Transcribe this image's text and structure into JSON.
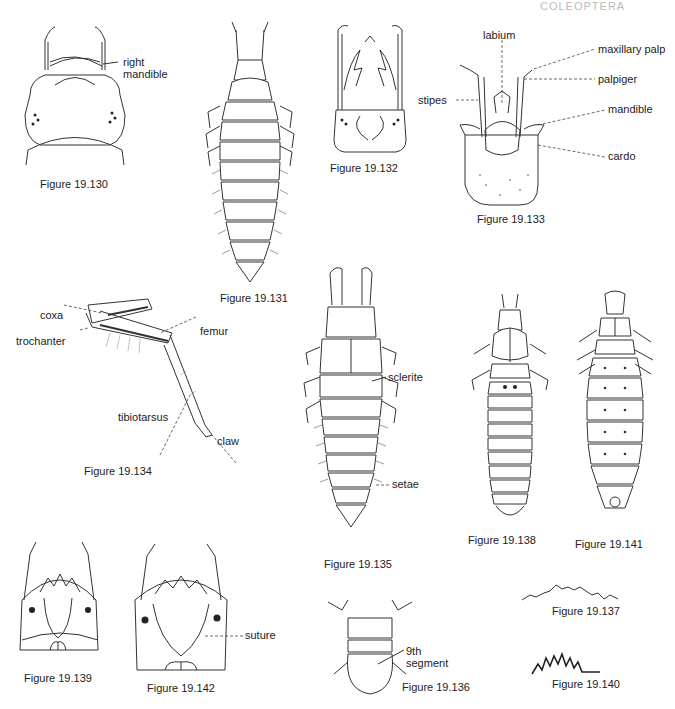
{
  "page_header": "COLEOPTERA",
  "figures": {
    "f130": {
      "caption": "Figure 19.130",
      "labels": [
        "right",
        "mandible"
      ]
    },
    "f131": {
      "caption": "Figure 19.131"
    },
    "f132": {
      "caption": "Figure 19.132"
    },
    "f133": {
      "caption": "Figure 19.133",
      "labels": {
        "labium": "labium",
        "maxillary_palp": "maxillary palp",
        "palpiger": "palpiger",
        "stipes": "stipes",
        "mandible": "mandible",
        "cardo": "cardo"
      }
    },
    "f134": {
      "caption": "Figure 19.134",
      "labels": {
        "coxa": "coxa",
        "trochanter": "trochanter",
        "femur": "femur",
        "tibiotarsus": "tibiotarsus",
        "claw": "claw"
      }
    },
    "f135": {
      "caption": "Figure 19.135",
      "labels": {
        "sclerite": "sclerite",
        "setae": "setae"
      }
    },
    "f136": {
      "caption": "Figure 19.136",
      "labels": [
        "9th",
        "segment"
      ]
    },
    "f137": {
      "caption": "Figure 19.137"
    },
    "f138": {
      "caption": "Figure 19.138"
    },
    "f139": {
      "caption": "Figure 19.139"
    },
    "f140": {
      "caption": "Figure 19.140"
    },
    "f141": {
      "caption": "Figure 19.141"
    },
    "f142": {
      "caption": "Figure 19.142",
      "labels": {
        "suture": "suture"
      }
    }
  }
}
